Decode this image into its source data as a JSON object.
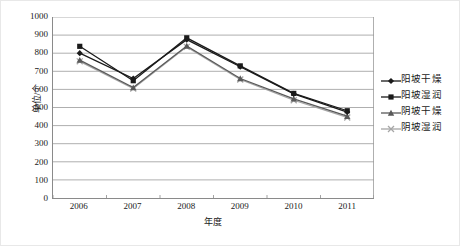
{
  "chart_data": {
    "type": "line",
    "title": "",
    "xlabel": "年度",
    "ylabel": "单位/个",
    "categories": [
      "2006",
      "2007",
      "2008",
      "2009",
      "2010",
      "2011"
    ],
    "x": [
      2006,
      2007,
      2008,
      2009,
      2010,
      2011
    ],
    "ylim": [
      0,
      1000
    ],
    "ytick_labels": [
      "1000",
      "900",
      "800",
      "700",
      "600",
      "500",
      "400",
      "300",
      "200",
      "100",
      "0"
    ],
    "ytick_values": [
      1000,
      900,
      800,
      700,
      600,
      500,
      400,
      300,
      200,
      100,
      0
    ],
    "grid": "horizontal",
    "legend_position": "right",
    "series": [
      {
        "name": "阳坡干燥",
        "marker": "diamond",
        "color": "#1a1a1a",
        "values": [
          800,
          660,
          875,
          725,
          575,
          475
        ]
      },
      {
        "name": "阳坡湿润",
        "marker": "square",
        "color": "#1a1a1a",
        "values": [
          838,
          648,
          885,
          730,
          578,
          482
        ]
      },
      {
        "name": "阴坡干燥",
        "marker": "triangle",
        "color": "#595959",
        "values": [
          762,
          610,
          840,
          660,
          548,
          452
        ]
      },
      {
        "name": "阴坡湿润",
        "marker": "cross",
        "color": "#a6a6a6",
        "values": [
          755,
          605,
          835,
          655,
          540,
          445
        ]
      }
    ]
  },
  "axes": {
    "y_title": "单位/个",
    "x_title": "年度"
  },
  "legend": {
    "items": [
      {
        "label": "阳坡干燥",
        "marker": "diamond-marker",
        "color": "#1a1a1a"
      },
      {
        "label": "阳坡湿润",
        "marker": "square-marker",
        "color": "#1a1a1a"
      },
      {
        "label": "阴坡干燥",
        "marker": "triangle-marker",
        "color": "#595959"
      },
      {
        "label": "阴坡湿润",
        "marker": "cross-marker",
        "color": "#a6a6a6"
      }
    ]
  }
}
